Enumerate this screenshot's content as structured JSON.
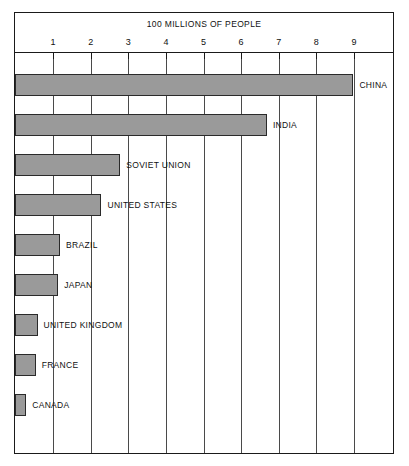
{
  "chart_data": {
    "type": "bar",
    "orientation": "horizontal",
    "title": "100 MILLIONS OF PEOPLE",
    "xlabel": "",
    "ylabel": "",
    "xlim": [
      0,
      9.6
    ],
    "grid": true,
    "legend": null,
    "xticks": [
      1,
      2,
      3,
      4,
      5,
      6,
      7,
      8,
      9
    ],
    "xtick_labels": [
      "1",
      "2",
      "3",
      "4",
      "5",
      "6",
      "7",
      "8",
      "9"
    ],
    "categories": [
      "CHINA",
      "INDIA",
      "SOVIET UNION",
      "UNITED STATES",
      "BRAZIL",
      "JAPAN",
      "UNITED KINGDOM",
      "FRANCE",
      "CANADA"
    ],
    "values": [
      9.0,
      6.7,
      2.8,
      2.3,
      1.2,
      1.15,
      0.6,
      0.55,
      0.3
    ],
    "units": "100 millions of people",
    "bar_color": "#9a9a9a",
    "bar_border_color": "#2a2a2a",
    "grid_color": "#4a4a4a",
    "frame_color": "#1a1a1a"
  },
  "bars": [
    {
      "label": "CHINA",
      "value": 9.0
    },
    {
      "label": "INDIA",
      "value": 6.7
    },
    {
      "label": "SOVIET UNION",
      "value": 2.8
    },
    {
      "label": "UNITED STATES",
      "value": 2.3
    },
    {
      "label": "BRAZIL",
      "value": 1.2
    },
    {
      "label": "JAPAN",
      "value": 1.15
    },
    {
      "label": "UNITED KINGDOM",
      "value": 0.6
    },
    {
      "label": "FRANCE",
      "value": 0.55
    },
    {
      "label": "CANADA",
      "value": 0.3
    }
  ]
}
